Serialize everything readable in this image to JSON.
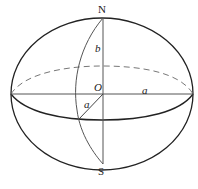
{
  "diagram": {
    "type": "ellipsoid",
    "labels": {
      "north": "N",
      "south": "S",
      "center": "O",
      "semi_minor": "b",
      "semi_major_horizontal": "a",
      "semi_major_oblique": "a"
    },
    "colors": {
      "outline": "#222222",
      "axis": "#555555",
      "dashed": "#777777"
    }
  }
}
